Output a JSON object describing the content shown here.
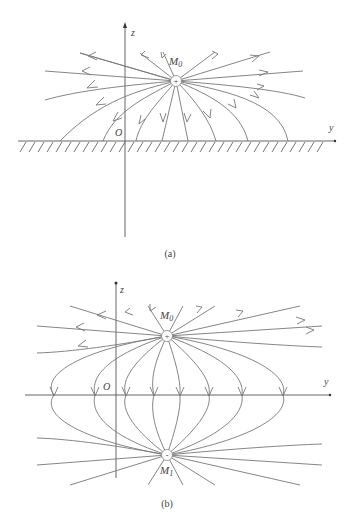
{
  "header_note": "…",
  "figure_a": {
    "caption": "(a)",
    "axis_z_label": "z",
    "axis_y_label": "y",
    "origin_label": "O",
    "charge_label_main": "M",
    "charge_label_sub": "0",
    "charge_sign": "+",
    "boundary": "grounded conducting plane (hatched)"
  },
  "figure_b": {
    "caption": "(b)",
    "axis_z_label": "z",
    "axis_y_label": "y",
    "origin_label": "O",
    "charge_top_label_main": "M",
    "charge_top_label_sub": "0",
    "charge_top_sign": "+",
    "charge_bottom_label_main": "M",
    "charge_bottom_label_sub": "1",
    "charge_bottom_sign": "-"
  },
  "colors": {
    "lines": "#777777",
    "axes": "#555555",
    "text": "#444444"
  }
}
